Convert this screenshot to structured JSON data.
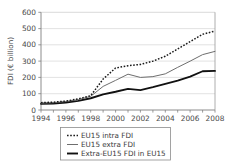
{
  "chart_data": {
    "type": "line",
    "title": "",
    "xlabel": "",
    "ylabel": "FDI (€ billion)",
    "xlim": [
      1994,
      2008
    ],
    "ylim": [
      0,
      600
    ],
    "grid": true,
    "legend_position": "below",
    "x": [
      1994,
      1995,
      1996,
      1997,
      1998,
      1999,
      2000,
      2001,
      2002,
      2003,
      2004,
      2005,
      2006,
      2007,
      2008
    ],
    "xticks": [
      "1994",
      "1996",
      "1998",
      "2000",
      "2002",
      "2004",
      "2006",
      "2008"
    ],
    "yticks": [
      "0",
      "100",
      "200",
      "300",
      "400",
      "500",
      "600"
    ],
    "series": [
      {
        "name": "EU15 intra FDI",
        "style": "dotted",
        "color": "#1a1a1a",
        "values": [
          45,
          48,
          55,
          68,
          88,
          190,
          258,
          272,
          280,
          300,
          330,
          375,
          420,
          465,
          485
        ]
      },
      {
        "name": "EU15 extra FDI",
        "style": "thin-solid",
        "color": "#6e6e6e",
        "values": [
          42,
          45,
          52,
          64,
          84,
          145,
          182,
          220,
          200,
          205,
          222,
          262,
          300,
          340,
          360
        ]
      },
      {
        "name": "Extra-EU15 FDI in EU15",
        "style": "thick-solid",
        "color": "#111111",
        "values": [
          38,
          40,
          46,
          56,
          72,
          96,
          112,
          130,
          122,
          140,
          160,
          180,
          205,
          238,
          240
        ]
      }
    ]
  },
  "legend": {
    "items": [
      {
        "label": "EU15 intra FDI",
        "marker": "dotted-line-marker"
      },
      {
        "label": "EU15 extra FDI",
        "marker": "thin-line-marker"
      },
      {
        "label": "Extra-EU15 FDI in EU15",
        "marker": "thick-line-marker"
      }
    ]
  },
  "axes": {
    "y_title": "FDI (€ billion)"
  }
}
